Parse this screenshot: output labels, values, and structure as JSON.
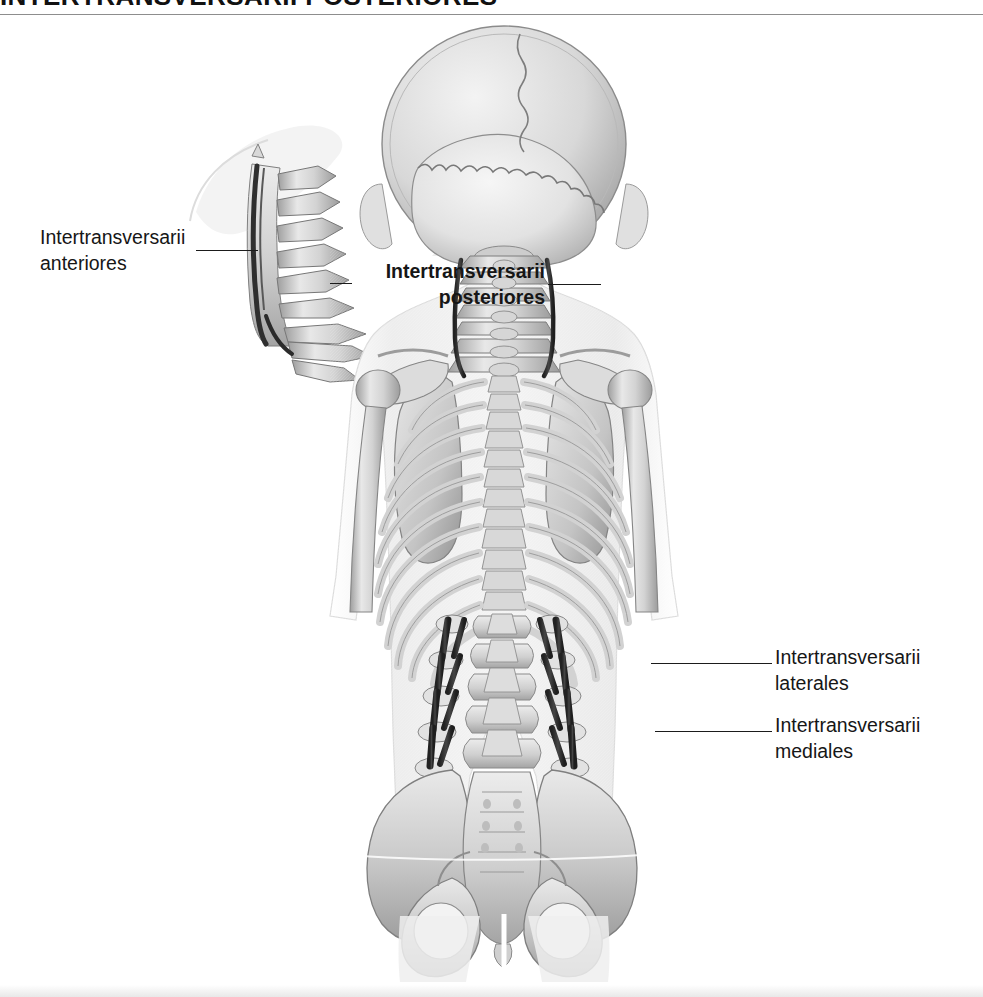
{
  "page": {
    "title": "INTERTRANSVERSARII POSTERIORES",
    "background_color": "#ffffff",
    "rule_color": "#8d8d8d"
  },
  "figure": {
    "type": "anatomical-illustration",
    "view": "posterior view of trunk skeleton with lateral cervical spine inset",
    "palette": {
      "bone_light": "#e4e4e4",
      "bone_mid": "#c2c2c2",
      "bone_shadow": "#8f8f8f",
      "body_silhouette": "#f0f0f0",
      "body_edge": "#cfcfcf",
      "muscle_highlight": "#3a3a3a",
      "outline": "#6f6f6f"
    },
    "regions": [
      {
        "name": "skull-posterior",
        "description": "occipital bone with lambdoid suture and sagittal suture"
      },
      {
        "name": "cervical-spine",
        "description": "cervical vertebrae C1-C7 with posterior intertransversarii"
      },
      {
        "name": "rib-cage",
        "description": "twelve pairs of ribs, posterior view"
      },
      {
        "name": "scapulae",
        "description": "left and right shoulder blades"
      },
      {
        "name": "humerus",
        "description": "upper arm bones within soft tissue"
      },
      {
        "name": "lumbar-spine",
        "description": "lumbar vertebrae with highlighted intertransversarii laterales and mediales"
      },
      {
        "name": "pelvis",
        "description": "ilium, sacrum, ischium with obturator foramina"
      }
    ]
  },
  "labels": [
    {
      "id": "intertransversarii-anteriores",
      "line1": "Intertransversarii",
      "line2": "anteriores",
      "bold": false,
      "align": "left",
      "x": 40,
      "y": 224
    },
    {
      "id": "intertransversarii-posteriores",
      "line1": "Intertransversarii",
      "line2": "posteriores",
      "bold": true,
      "align": "right",
      "x": 355,
      "y": 258
    },
    {
      "id": "intertransversarii-laterales",
      "line1": "Intertransversarii",
      "line2": "laterales",
      "bold": false,
      "align": "left",
      "x": 775,
      "y": 644
    },
    {
      "id": "intertransversarii-mediales",
      "line1": "Intertransversarii",
      "line2": "mediales",
      "bold": false,
      "align": "left",
      "x": 775,
      "y": 712
    }
  ],
  "leader_lines": [
    {
      "id": "leader-anteriores",
      "x1": 196,
      "y1": 250,
      "x2": 258,
      "y2": 250
    },
    {
      "id": "leader-posteriores-left",
      "x1": 330,
      "y1": 283,
      "x2": 352,
      "y2": 283
    },
    {
      "id": "leader-posteriores-right",
      "x1": 548,
      "y1": 284,
      "x2": 601,
      "y2": 284
    },
    {
      "id": "leader-laterales",
      "x1": 651,
      "y1": 663,
      "x2": 772,
      "y2": 663
    },
    {
      "id": "leader-mediales",
      "x1": 655,
      "y1": 731,
      "x2": 772,
      "y2": 731
    }
  ]
}
